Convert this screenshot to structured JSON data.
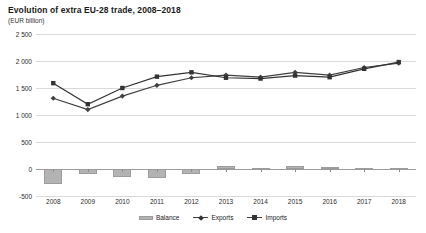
{
  "chart_data": {
    "type": "line",
    "title": "Evolution of extra EU-28 trade, 2008–2018",
    "subtitle": "(EUR billion)",
    "xlabel": "",
    "ylabel": "",
    "unit": "EUR billion",
    "categories": [
      "2008",
      "2009",
      "2010",
      "2011",
      "2012",
      "2013",
      "2014",
      "2015",
      "2016",
      "2017",
      "2018"
    ],
    "ylim": [
      -500,
      2500
    ],
    "yticks": [
      "-500",
      "0",
      "500",
      "1 000",
      "1 500",
      "2 000",
      "2 500"
    ],
    "ytick_values": [
      -500,
      0,
      500,
      1000,
      1500,
      2000,
      2500
    ],
    "grid": true,
    "legend_position": "bottom",
    "series": [
      {
        "name": "Balance",
        "type": "bar",
        "color": "#b3b3b3",
        "values": [
          -280,
          -100,
          -150,
          -160,
          -100,
          50,
          25,
          60,
          40,
          25,
          20
        ]
      },
      {
        "name": "Exports",
        "type": "line",
        "marker": "diamond",
        "color": "#404040",
        "values": [
          1310,
          1100,
          1350,
          1550,
          1690,
          1740,
          1700,
          1790,
          1740,
          1880,
          1960
        ]
      },
      {
        "name": "Imports",
        "type": "line",
        "marker": "square",
        "color": "#333333",
        "values": [
          1590,
          1200,
          1500,
          1710,
          1790,
          1690,
          1675,
          1730,
          1700,
          1855,
          1980
        ]
      }
    ]
  },
  "legend": {
    "items": [
      {
        "label": "Balance",
        "icon": "bar-swatch-icon"
      },
      {
        "label": "Exports",
        "icon": "line-diamond-marker-icon"
      },
      {
        "label": "Imports",
        "icon": "line-square-marker-icon"
      }
    ]
  },
  "colors": {
    "balance_bar": "#b3b3b3",
    "exports_line": "#404040",
    "imports_line": "#333333",
    "gridline": "#d9d9d9",
    "zero_line": "#9a9a9a",
    "text": "#1a1a1a",
    "background": "#ffffff"
  }
}
